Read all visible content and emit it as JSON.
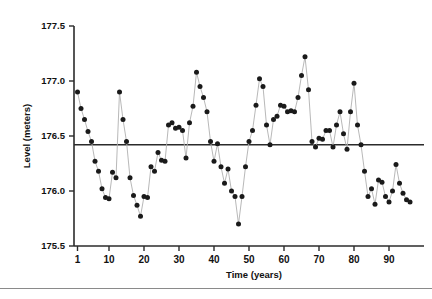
{
  "chart_data": {
    "type": "scatter",
    "title": "",
    "subtitle": "",
    "xlabel": "Time (years)",
    "ylabel": "Level (meters)",
    "xlim": [
      0,
      100
    ],
    "ylim": [
      175.5,
      177.5
    ],
    "xticks": [
      1,
      10,
      20,
      30,
      40,
      50,
      60,
      70,
      80,
      90
    ],
    "xtick_labels": [
      "1",
      "10",
      "20",
      "30",
      "40",
      "50",
      "60",
      "70",
      "80",
      "90"
    ],
    "yticks": [
      175.5,
      176.0,
      176.5,
      177.0,
      177.5
    ],
    "ytick_labels": [
      "175.5",
      "176.0",
      "176.5",
      "177.0",
      "177.5"
    ],
    "grid": false,
    "legend": null,
    "series_name": "Level",
    "marker": "filled-circle",
    "marker_color": "#1a1a1a",
    "line_color": "#b0b0b0",
    "reference_line": {
      "orientation": "horizontal",
      "value": 176.42,
      "color": "#2b2b2b",
      "label": ""
    },
    "x": [
      1,
      2,
      3,
      4,
      5,
      6,
      7,
      8,
      9,
      10,
      11,
      12,
      13,
      14,
      15,
      16,
      17,
      18,
      19,
      20,
      21,
      22,
      23,
      24,
      25,
      26,
      27,
      28,
      29,
      30,
      31,
      32,
      33,
      34,
      35,
      36,
      37,
      38,
      39,
      40,
      41,
      42,
      43,
      44,
      45,
      46,
      47,
      48,
      49,
      50,
      51,
      52,
      53,
      54,
      55,
      56,
      57,
      58,
      59,
      60,
      61,
      62,
      63,
      64,
      65,
      66,
      67,
      68,
      69,
      70,
      71,
      72,
      73,
      74,
      75,
      76,
      77,
      78,
      79,
      80,
      81,
      82,
      83,
      84,
      85,
      86,
      87,
      88,
      89,
      90,
      91,
      92,
      93,
      94,
      95,
      96
    ],
    "values": [
      176.9,
      176.75,
      176.65,
      176.54,
      176.45,
      176.27,
      176.18,
      176.02,
      175.94,
      175.93,
      176.17,
      176.12,
      176.9,
      176.65,
      176.45,
      176.12,
      175.96,
      175.87,
      175.77,
      175.95,
      175.94,
      176.22,
      176.18,
      176.35,
      176.28,
      176.27,
      176.6,
      176.62,
      176.57,
      176.58,
      176.55,
      176.3,
      176.62,
      176.77,
      177.08,
      176.95,
      176.85,
      176.72,
      176.45,
      176.27,
      176.43,
      176.22,
      176.07,
      176.2,
      176.0,
      175.95,
      175.7,
      175.95,
      176.22,
      176.45,
      176.55,
      176.78,
      177.02,
      176.95,
      176.6,
      176.42,
      176.65,
      176.68,
      176.78,
      176.77,
      176.72,
      176.73,
      176.72,
      176.85,
      177.05,
      177.22,
      176.92,
      176.45,
      176.4,
      176.48,
      176.47,
      176.55,
      176.55,
      176.4,
      176.6,
      176.72,
      176.52,
      176.38,
      176.72,
      176.98,
      176.6,
      176.42,
      176.18,
      175.95,
      176.02,
      175.88,
      176.1,
      176.08,
      175.95,
      175.9,
      176.0,
      176.24,
      176.07,
      175.98,
      175.92,
      175.9
    ]
  },
  "axis": {
    "y_title": "Level (meters)",
    "x_title": "Time (years)"
  }
}
